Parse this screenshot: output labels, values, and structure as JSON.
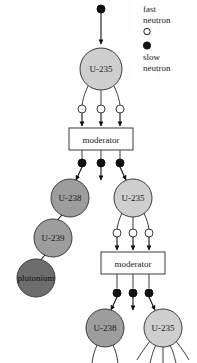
{
  "legend": {
    "fast": {
      "line1": "fast",
      "line2": "neutron",
      "marker": "open-circle"
    },
    "slow": {
      "line1": "slow",
      "line2": "neutron",
      "marker": "filled-circle"
    }
  },
  "colors": {
    "u235_fill": "#cfcfcf",
    "u238_fill": "#9d9d9d",
    "u239_fill": "#9d9d9d",
    "plutonium_fill": "#6d6d6d",
    "stroke": "#3a3a3a",
    "neutron_slow_fill": "#111111",
    "neutron_fast_fill": "#ffffff",
    "box_fill": "#ffffff",
    "text": "#1a1a1a"
  },
  "nodes": {
    "u235_top": {
      "label": "U-235",
      "type": "u235"
    },
    "u238_mid_left": {
      "label": "U-238",
      "type": "u238"
    },
    "u235_mid_right": {
      "label": "U-235",
      "type": "u235"
    },
    "u239": {
      "label": "U-239",
      "type": "u239"
    },
    "plutonium": {
      "label": "plutonium",
      "type": "plutonium"
    },
    "u238_bottom": {
      "label": "U-238",
      "type": "u238"
    },
    "u235_bottom": {
      "label": "U-235",
      "type": "u235"
    }
  },
  "boxes": {
    "moderator_1": {
      "label": "moderator"
    },
    "moderator_2": {
      "label": "moderator"
    }
  },
  "neutrons": {
    "incident_slow_count": 1,
    "stage1_fast_count": 3,
    "stage1_slow_count": 3,
    "stage2_fast_count": 3,
    "stage2_slow_count": 3
  }
}
